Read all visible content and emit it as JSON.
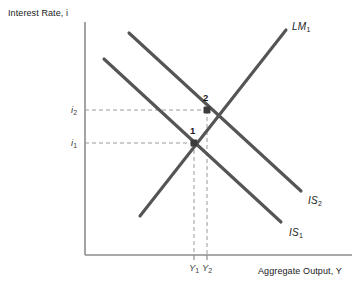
{
  "figure": {
    "width": 362,
    "height": 305,
    "background": "#ffffff"
  },
  "axes": {
    "y_title": "Interest Rate, i",
    "x_title": "Aggregate Output, Y",
    "origin": [
      85,
      255
    ],
    "x_end": [
      352,
      255
    ],
    "y_top": [
      85,
      22
    ],
    "color": "#8c8c8c"
  },
  "colors": {
    "curve": "#555555",
    "axis": "#8c8c8c",
    "guide": "#9a9a9a",
    "marker": "#3d3d3d",
    "text": "#1a1a1a"
  },
  "ticks": {
    "y": [
      {
        "label": "i",
        "sub": "2",
        "value_y": 110
      },
      {
        "label": "i",
        "sub": "1",
        "value_y": 143
      }
    ],
    "x": [
      {
        "label": "Y",
        "sub": "1",
        "value_x": 194
      },
      {
        "label": "Y",
        "sub": "2",
        "value_x": 207
      }
    ]
  },
  "curves": [
    {
      "name": "LM1",
      "label": "LM",
      "sub": "1",
      "slope": "upward",
      "x1": 140,
      "y1": 216,
      "x2": 286,
      "y2": 30,
      "label_x": 292,
      "label_y": 22
    },
    {
      "name": "IS2",
      "label": "IS",
      "sub": "2",
      "slope": "downward",
      "x1": 129,
      "y1": 33,
      "x2": 301,
      "y2": 191,
      "label_x": 308,
      "label_y": 196
    },
    {
      "name": "IS1",
      "label": "IS",
      "sub": "1",
      "slope": "downward",
      "x1": 104,
      "y1": 59,
      "x2": 281,
      "y2": 222,
      "label_x": 289,
      "label_y": 228
    }
  ],
  "equilibria": [
    {
      "label": "1",
      "x": 194,
      "y": 143,
      "label_x": 190,
      "label_y": 126
    },
    {
      "label": "2",
      "x": 207,
      "y": 110,
      "label_x": 203,
      "label_y": 93
    }
  ],
  "chart_data": {
    "type": "line",
    "title": "",
    "xlabel": "Aggregate Output, Y",
    "ylabel": "Interest Rate, i",
    "grid": false,
    "legend": "inline-curve-labels",
    "series": [
      {
        "name": "LM1",
        "points": [
          [
            140,
            216
          ],
          [
            286,
            30
          ]
        ]
      },
      {
        "name": "IS2",
        "points": [
          [
            129,
            33
          ],
          [
            301,
            191
          ]
        ]
      },
      {
        "name": "IS1",
        "points": [
          [
            104,
            59
          ],
          [
            281,
            222
          ]
        ]
      }
    ],
    "annotations": [
      {
        "text": "1",
        "x": 194,
        "y": 143,
        "note": "equilibrium of IS1 and LM1 at (Y1, i1)"
      },
      {
        "text": "2",
        "x": 207,
        "y": 110,
        "note": "equilibrium of IS2 and LM1 at (Y2, i2)"
      }
    ],
    "xticks": [
      "Y1",
      "Y2"
    ],
    "yticks": [
      "i1",
      "i2"
    ]
  }
}
